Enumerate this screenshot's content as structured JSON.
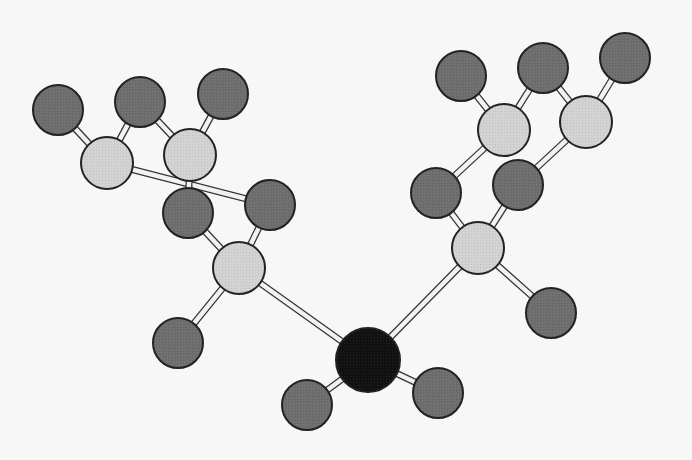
{
  "diagram": {
    "title": "",
    "type": "ball-and-stick molecular model",
    "colors": {
      "background": "#f7f7f7",
      "dark_atom": "#6e6e6e",
      "light_atom": "#d2d2d2",
      "center_atom": "#111111",
      "outline": "#222222",
      "bond_fill": "#f2f2f2",
      "bond_edge": "#333333"
    },
    "atoms": [
      {
        "id": "a1",
        "kind": "dark",
        "x": 58,
        "y": 110,
        "r": 25
      },
      {
        "id": "a2",
        "kind": "light",
        "x": 107,
        "y": 163,
        "r": 26
      },
      {
        "id": "a3",
        "kind": "dark",
        "x": 140,
        "y": 102,
        "r": 25
      },
      {
        "id": "a4",
        "kind": "light",
        "x": 190,
        "y": 155,
        "r": 26
      },
      {
        "id": "a5",
        "kind": "dark",
        "x": 223,
        "y": 94,
        "r": 25
      },
      {
        "id": "a6",
        "kind": "dark",
        "x": 270,
        "y": 205,
        "r": 25
      },
      {
        "id": "a7",
        "kind": "dark",
        "x": 188,
        "y": 213,
        "r": 25
      },
      {
        "id": "a8",
        "kind": "light",
        "x": 239,
        "y": 268,
        "r": 26
      },
      {
        "id": "a9",
        "kind": "dark",
        "x": 178,
        "y": 343,
        "r": 25
      },
      {
        "id": "a10",
        "kind": "dark",
        "x": 461,
        "y": 76,
        "r": 25
      },
      {
        "id": "a11",
        "kind": "dark",
        "x": 543,
        "y": 68,
        "r": 25
      },
      {
        "id": "a12",
        "kind": "dark",
        "x": 625,
        "y": 58,
        "r": 25
      },
      {
        "id": "a13",
        "kind": "light",
        "x": 504,
        "y": 130,
        "r": 26
      },
      {
        "id": "a14",
        "kind": "light",
        "x": 586,
        "y": 122,
        "r": 26
      },
      {
        "id": "a15",
        "kind": "dark",
        "x": 436,
        "y": 193,
        "r": 25
      },
      {
        "id": "a16",
        "kind": "dark",
        "x": 518,
        "y": 185,
        "r": 25
      },
      {
        "id": "a17",
        "kind": "light",
        "x": 478,
        "y": 248,
        "r": 26
      },
      {
        "id": "a18",
        "kind": "dark",
        "x": 551,
        "y": 313,
        "r": 25
      },
      {
        "id": "a19",
        "kind": "center",
        "x": 368,
        "y": 360,
        "r": 32
      },
      {
        "id": "a20",
        "kind": "dark",
        "x": 307,
        "y": 405,
        "r": 25
      },
      {
        "id": "a21",
        "kind": "dark",
        "x": 438,
        "y": 393,
        "r": 25
      }
    ],
    "bonds": [
      [
        "a1",
        "a2"
      ],
      [
        "a3",
        "a2"
      ],
      [
        "a2",
        "a6"
      ],
      [
        "a3",
        "a4"
      ],
      [
        "a5",
        "a4"
      ],
      [
        "a4",
        "a7"
      ],
      [
        "a7",
        "a8"
      ],
      [
        "a6",
        "a8"
      ],
      [
        "a8",
        "a9"
      ],
      [
        "a8",
        "a19"
      ],
      [
        "a10",
        "a13"
      ],
      [
        "a11",
        "a13"
      ],
      [
        "a13",
        "a15"
      ],
      [
        "a11",
        "a14"
      ],
      [
        "a12",
        "a14"
      ],
      [
        "a14",
        "a16"
      ],
      [
        "a15",
        "a17"
      ],
      [
        "a16",
        "a17"
      ],
      [
        "a17",
        "a18"
      ],
      [
        "a17",
        "a19"
      ],
      [
        "a19",
        "a20"
      ],
      [
        "a19",
        "a21"
      ]
    ]
  }
}
